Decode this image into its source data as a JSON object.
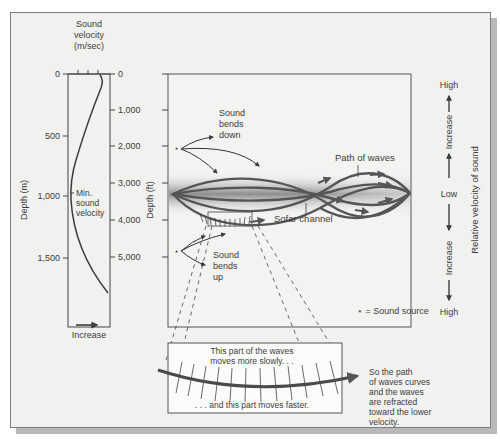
{
  "left_profile": {
    "title_lines": [
      "Sound",
      "velocity",
      "(m/sec)"
    ],
    "y_axis_left_label": "Depth (m)",
    "y_axis_left_ticks": [
      "0",
      "500",
      "1,000",
      "1,500"
    ],
    "y_axis_right_label": "Depth (ft)",
    "y_axis_right_ticks": [
      "0",
      "1,000",
      "2,000",
      "3,000",
      "4,000",
      "5,000"
    ],
    "min_label_lines": [
      "Min.",
      "sound",
      "velocity"
    ],
    "x_direction_label": "Increase"
  },
  "main_panel": {
    "sound_bends_down_lines": [
      "Sound",
      "bends",
      "down"
    ],
    "sound_bends_up_lines": [
      "Sound",
      "bends",
      "up"
    ],
    "path_of_waves_label": "Path of waves",
    "sofar_channel_label": "Sofar channel",
    "legend_label": "⋆ = Sound source"
  },
  "right_scale": {
    "top_label": "High",
    "upper_increase": "Increase",
    "middle_label": "Low",
    "lower_increase": "Increase",
    "bottom_label": "High",
    "axis_title": "Relative velocity of sound"
  },
  "inset": {
    "top_text_lines": [
      "This part of the waves",
      "moves more slowly. . ."
    ],
    "bottom_text": ". . . and this part moves faster.",
    "explanation_lines": [
      "So the path",
      "of waves curves",
      "and the waves",
      "are refracted",
      "toward the lower",
      "velocity."
    ]
  },
  "colors": {
    "background": "#f1f1ef",
    "ink": "#3c3c3c",
    "wave": "#545454",
    "channel_gray": "#9a9a9a"
  }
}
